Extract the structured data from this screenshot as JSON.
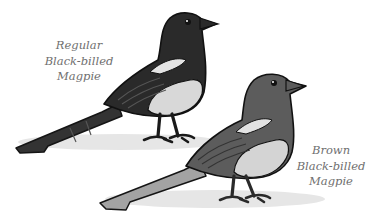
{
  "illustration": {
    "subject": "Two magpies comparison",
    "birds": [
      {
        "id": "regular",
        "caption_lines": [
          "Regular",
          "Black-billed",
          "Magpie"
        ],
        "colors": {
          "body": "#2b2b2b",
          "belly": "#d9d9d9",
          "wing_patch": "#e6e6e6",
          "tail": "#3a3a3a",
          "shadow": "#e8e8e8"
        }
      },
      {
        "id": "brown",
        "caption_lines": [
          "Brown",
          "Black-billed",
          "Magpie"
        ],
        "colors": {
          "body": "#5a5a5a",
          "belly": "#d4d4d4",
          "wing_patch": "#e3e3e3",
          "tail": "#9a9a9a",
          "shadow": "#e8e8e8"
        }
      }
    ],
    "text_color": "#6f6f6f",
    "outline_color": "#1a1a1a"
  }
}
